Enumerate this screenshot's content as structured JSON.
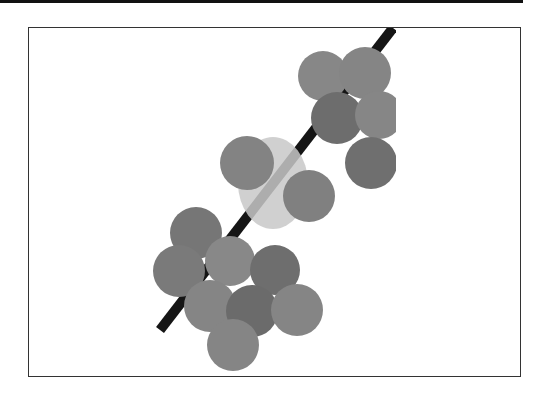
{
  "figure": {
    "frame": {
      "x": 28,
      "y": 27,
      "width": 493,
      "height": 350,
      "stroke": "#333333"
    },
    "top_bar": {
      "color": "#111111"
    },
    "clip_right_x": 396,
    "line": {
      "x1": 160,
      "y1": 330,
      "x2": 393,
      "y2": 28,
      "width": 10,
      "color": "#151515"
    },
    "translucent_blob": {
      "cx": 273,
      "cy": 183,
      "rx": 35,
      "ry": 46,
      "color": "#c8c8c8",
      "opacity": 0.85
    },
    "discs": [
      {
        "id": "A",
        "cx": 323,
        "cy": 76,
        "r": 25,
        "color": "#878787"
      },
      {
        "id": "B",
        "cx": 365,
        "cy": 73,
        "r": 26,
        "color": "#858585"
      },
      {
        "id": "C",
        "cx": 337,
        "cy": 118,
        "r": 26,
        "color": "#6d6d6d"
      },
      {
        "id": "D",
        "cx": 379,
        "cy": 115,
        "r": 24,
        "color": "#868686"
      },
      {
        "id": "E",
        "cx": 371,
        "cy": 163,
        "r": 26,
        "color": "#6f6f6f"
      },
      {
        "id": "F",
        "cx": 247,
        "cy": 163,
        "r": 27,
        "color": "#838383"
      },
      {
        "id": "G",
        "cx": 309,
        "cy": 196,
        "r": 26,
        "color": "#808080"
      },
      {
        "id": "H",
        "cx": 196,
        "cy": 233,
        "r": 26,
        "color": "#767676"
      },
      {
        "id": "I",
        "cx": 179,
        "cy": 271,
        "r": 26,
        "color": "#7a7a7a"
      },
      {
        "id": "J",
        "cx": 230,
        "cy": 261,
        "r": 25,
        "color": "#888888"
      },
      {
        "id": "K",
        "cx": 275,
        "cy": 270,
        "r": 25,
        "color": "#6e6e6e"
      },
      {
        "id": "L",
        "cx": 210,
        "cy": 306,
        "r": 26,
        "color": "#858585"
      },
      {
        "id": "M",
        "cx": 252,
        "cy": 311,
        "r": 26,
        "color": "#6b6b6b"
      },
      {
        "id": "N",
        "cx": 297,
        "cy": 310,
        "r": 26,
        "color": "#858585"
      },
      {
        "id": "O",
        "cx": 233,
        "cy": 345,
        "r": 26,
        "color": "#858585"
      }
    ]
  }
}
